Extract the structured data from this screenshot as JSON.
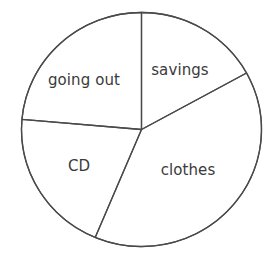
{
  "chart_data": {
    "type": "pie",
    "title": "",
    "subtitle": "",
    "xlabel": "",
    "ylabel": "",
    "legend": "none",
    "grid": false,
    "labels_inside_slices": true,
    "categories": [
      "savings",
      "clothes",
      "CD",
      "going out"
    ],
    "values": [
      17,
      39,
      20,
      24
    ],
    "units": "percent",
    "slices": [
      {
        "name": "savings",
        "label": "savings",
        "value": 17,
        "start_angle_deg": 90,
        "end_angle_deg": 28.9,
        "sweep_deg": 61.1,
        "label_x": 180,
        "label_y": 70
      },
      {
        "name": "clothes",
        "label": "clothes",
        "value": 39,
        "start_angle_deg": 28.9,
        "end_angle_deg": -112.7,
        "sweep_deg": 141.6,
        "label_x": 188,
        "label_y": 170
      },
      {
        "name": "CD",
        "label": "CD",
        "value": 20,
        "start_angle_deg": 247.3,
        "end_angle_deg": 175,
        "sweep_deg": 72.3,
        "label_x": 79,
        "label_y": 166
      },
      {
        "name": "going out",
        "label": "going out",
        "value": 24,
        "start_angle_deg": 175,
        "end_angle_deg": 90,
        "sweep_deg": 85,
        "label_x": 84,
        "label_y": 80
      }
    ],
    "geometry": {
      "center_x": 141.5,
      "center_y": 129.5,
      "radius_x": 120,
      "radius_y": 117
    },
    "colors": {
      "background": "#ffffff",
      "outline": "#4a4a4a",
      "slice_fill": "#ffffff",
      "label_text": "#3a3a3a"
    }
  }
}
